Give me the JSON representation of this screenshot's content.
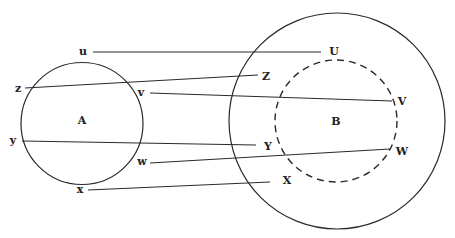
{
  "diagram": {
    "sets": [
      {
        "id": "A",
        "label": "A",
        "cx": 82,
        "cy": 123.5,
        "r": 61,
        "style": "solid",
        "label_x": 82,
        "label_y": 124
      },
      {
        "id": "outer",
        "label": "",
        "cx": 337,
        "cy": 121,
        "r": 108,
        "style": "solid"
      },
      {
        "id": "B",
        "label": "B",
        "cx": 336,
        "cy": 121,
        "r": 61,
        "style": "dashed",
        "label_x": 336,
        "label_y": 125
      }
    ],
    "points": {
      "u": {
        "label": "u",
        "x": 83,
        "y": 55
      },
      "z": {
        "label": "z",
        "x": 18,
        "y": 92
      },
      "v": {
        "label": "v",
        "x": 141,
        "y": 96
      },
      "y": {
        "label": "y",
        "x": 13,
        "y": 144
      },
      "w": {
        "label": "w",
        "x": 142,
        "y": 165
      },
      "x": {
        "label": "x",
        "x": 80,
        "y": 193
      },
      "U": {
        "label": "U",
        "x": 334,
        "y": 55
      },
      "Z": {
        "label": "Z",
        "x": 266,
        "y": 80
      },
      "V": {
        "label": "V",
        "x": 402,
        "y": 105
      },
      "Y": {
        "label": "Y",
        "x": 268,
        "y": 150
      },
      "W": {
        "label": "W",
        "x": 402,
        "y": 155
      },
      "X": {
        "label": "X",
        "x": 287,
        "y": 184
      }
    },
    "mappings": [
      {
        "from": "u",
        "to": "U",
        "x1": 93,
        "y1": 52,
        "x2": 321,
        "y2": 52
      },
      {
        "from": "z",
        "to": "Z",
        "x1": 25,
        "y1": 88,
        "x2": 258,
        "y2": 75
      },
      {
        "from": "v",
        "to": "V",
        "x1": 150,
        "y1": 93,
        "x2": 392,
        "y2": 101
      },
      {
        "from": "y",
        "to": "Y",
        "x1": 22,
        "y1": 141,
        "x2": 256,
        "y2": 145
      },
      {
        "from": "w",
        "to": "W",
        "x1": 150,
        "y1": 163,
        "x2": 390,
        "y2": 149
      },
      {
        "from": "x",
        "to": "X",
        "x1": 88,
        "y1": 190,
        "x2": 270,
        "y2": 182
      }
    ]
  }
}
